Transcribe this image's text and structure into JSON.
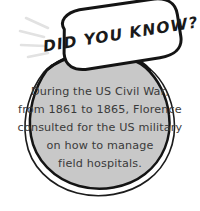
{
  "card": {
    "kind": "did-you-know-fact-card",
    "heading": "DID YOU KNOW?",
    "body_lines": [
      "During the US Civil War,",
      "from 1861 to 1865, Florence",
      "consulted for the US military",
      "on how to manage",
      "field hospitals."
    ],
    "body_text": "During the US Civil War, from 1861 to 1865, Florence consulted for the US military on how to manage field hospitals.",
    "colors": {
      "background": "#ffffff",
      "bubble_fill": "#ffffff",
      "bubble_outline": "#141414",
      "blob_fill": "#c8c8c8",
      "blob_outline": "#141414",
      "blob_outline_secondary": "#1c1c1c",
      "heading_text": "#1a1a1a",
      "body_text": "#3a3a3a",
      "sparkle": "#e2e2e2"
    },
    "decorations": {
      "sparkle_label": "sparkle-lines",
      "sparkle_count": 4
    }
  }
}
